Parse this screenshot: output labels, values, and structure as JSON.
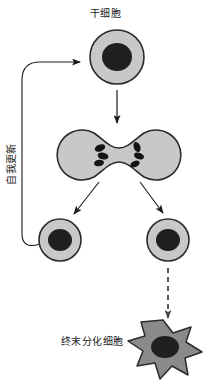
{
  "diagram": {
    "language": "zh",
    "background_color": "#ffffff",
    "labels": {
      "stem_cell": "干细胞",
      "self_renewal": "自我更新",
      "terminal_cell": "终末分化细胞"
    },
    "colors": {
      "cell_fill": "#c8c8c8",
      "cell_stroke": "#2b2b2b",
      "nucleus_fill": "#1f1f1f",
      "differentiated_fill": "#8a8a8a",
      "arrow_stroke": "#1a1a1a",
      "text_color": "#1a1a1a"
    },
    "nodes": [
      {
        "id": "stem-cell",
        "type": "round-cell",
        "label": "干细胞",
        "cx": 117,
        "cy": 57,
        "r": 27,
        "nucleus_rx": 15,
        "nucleus_ry": 14
      },
      {
        "id": "dividing-cell",
        "type": "dividing-cell",
        "label": "",
        "cx": 119,
        "cy": 155,
        "lobe_r": 25,
        "chromosome_count": 6
      },
      {
        "id": "daughter-cell-left",
        "type": "round-cell",
        "label": "",
        "cx": 60,
        "cy": 240,
        "r": 21,
        "nucleus_rx": 12,
        "nucleus_ry": 11
      },
      {
        "id": "daughter-cell-right",
        "type": "round-cell",
        "label": "",
        "cx": 168,
        "cy": 240,
        "r": 21,
        "nucleus_rx": 12,
        "nucleus_ry": 11
      },
      {
        "id": "terminal-differentiated-cell",
        "type": "stellate-cell",
        "label": "终末分化细胞",
        "cx": 163,
        "cy": 348,
        "r": 28,
        "nucleus_rx": 14,
        "nucleus_ry": 11
      }
    ],
    "edges": [
      {
        "id": "self-renewal-feedback",
        "from": "daughter-cell-left",
        "to": "stem-cell",
        "style": "solid",
        "shape": "curved-loop",
        "label": "自我更新"
      },
      {
        "id": "stem-to-division",
        "from": "stem-cell",
        "to": "dividing-cell",
        "style": "solid",
        "shape": "straight-vertical",
        "label": ""
      },
      {
        "id": "division-to-left-daughter",
        "from": "dividing-cell",
        "to": "daughter-cell-left",
        "style": "solid",
        "shape": "diagonal",
        "label": ""
      },
      {
        "id": "division-to-right-daughter",
        "from": "dividing-cell",
        "to": "daughter-cell-right",
        "style": "solid",
        "shape": "diagonal",
        "label": ""
      },
      {
        "id": "daughter-to-terminal",
        "from": "daughter-cell-right",
        "to": "terminal-differentiated-cell",
        "style": "dashed",
        "shape": "straight-vertical",
        "label": ""
      }
    ]
  }
}
